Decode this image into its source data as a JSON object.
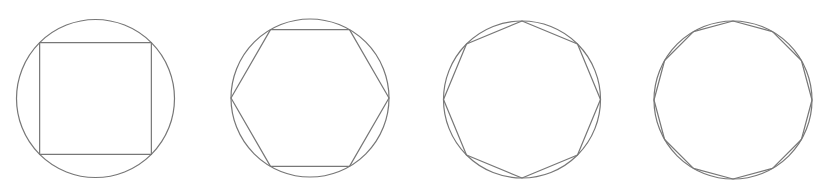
{
  "diagram": {
    "title": "",
    "stroke_color": "#777777",
    "stroke_width": 1.2,
    "background": "#ffffff",
    "figures": [
      {
        "name": "square-in-circle",
        "sides": 4,
        "cx": 95.5,
        "cy": 98.5,
        "r": 79,
        "rotation_deg": 45
      },
      {
        "name": "hexagon-in-circle",
        "sides": 6,
        "cx": 310,
        "cy": 98,
        "r": 79,
        "rotation_deg": 0
      },
      {
        "name": "octagon-in-circle",
        "sides": 8,
        "cx": 522,
        "cy": 99.5,
        "r": 78.5,
        "rotation_deg": 90
      },
      {
        "name": "dodecagon-in-circle",
        "sides": 12,
        "cx": 733,
        "cy": 100,
        "r": 79,
        "rotation_deg": 90
      }
    ]
  }
}
